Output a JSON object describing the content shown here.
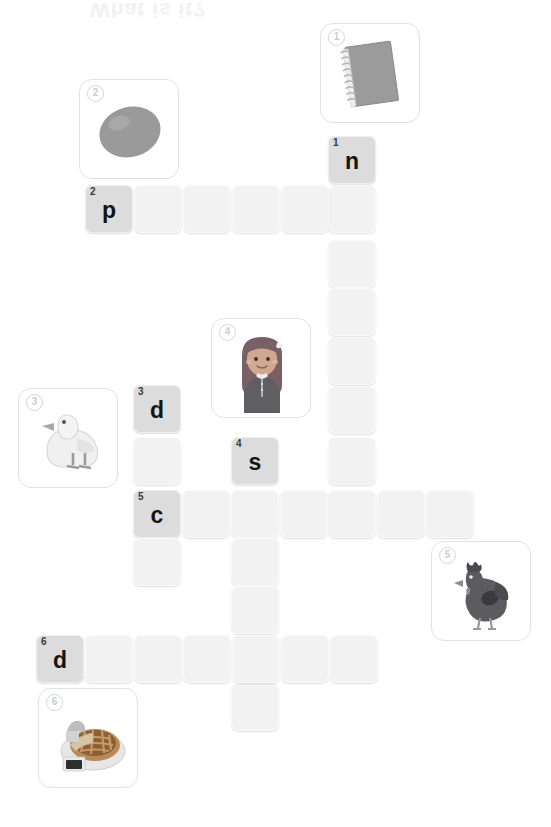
{
  "page": {
    "title_ghost": "What is it?",
    "type": "picture-crossword-worksheet"
  },
  "grid": {
    "cell_size": 48,
    "pitch_x": 49,
    "origin_x": 36,
    "filled_color": "#dcdcdc",
    "empty_color": "#f2f2f2"
  },
  "cells": [
    {
      "id": "c-1-n",
      "x": 328,
      "y": 136,
      "num": "1",
      "letter": "n",
      "filled": true
    },
    {
      "id": "c-r1-2",
      "x": 328,
      "y": 185,
      "num": "",
      "letter": "",
      "filled": false
    },
    {
      "id": "c-r1-3",
      "x": 328,
      "y": 240,
      "num": "",
      "letter": "",
      "filled": false
    },
    {
      "id": "c-r1-4",
      "x": 328,
      "y": 288,
      "num": "",
      "letter": "",
      "filled": false
    },
    {
      "id": "c-r1-5",
      "x": 328,
      "y": 337,
      "num": "",
      "letter": "",
      "filled": false
    },
    {
      "id": "c-r1-6",
      "x": 328,
      "y": 386,
      "num": "",
      "letter": "",
      "filled": false
    },
    {
      "id": "c-r1-7",
      "x": 328,
      "y": 437,
      "num": "",
      "letter": "",
      "filled": false
    },
    {
      "id": "c-r1-8",
      "x": 328,
      "y": 490,
      "num": "",
      "letter": "",
      "filled": false
    },
    {
      "id": "c-2-p",
      "x": 85,
      "y": 185,
      "num": "2",
      "letter": "p",
      "filled": true
    },
    {
      "id": "c-r2-2",
      "x": 134,
      "y": 185,
      "num": "",
      "letter": "",
      "filled": false
    },
    {
      "id": "c-r2-3",
      "x": 183,
      "y": 185,
      "num": "",
      "letter": "",
      "filled": false
    },
    {
      "id": "c-r2-4",
      "x": 232,
      "y": 185,
      "num": "",
      "letter": "",
      "filled": false
    },
    {
      "id": "c-r2-5",
      "x": 281,
      "y": 185,
      "num": "",
      "letter": "",
      "filled": false
    },
    {
      "id": "c-3-d",
      "x": 133,
      "y": 385,
      "num": "3",
      "letter": "d",
      "filled": true
    },
    {
      "id": "c-r3-2",
      "x": 133,
      "y": 437,
      "num": "",
      "letter": "",
      "filled": false
    },
    {
      "id": "c-4-s",
      "x": 231,
      "y": 437,
      "num": "4",
      "letter": "s",
      "filled": true
    },
    {
      "id": "c-5-c",
      "x": 133,
      "y": 490,
      "num": "5",
      "letter": "c",
      "filled": true
    },
    {
      "id": "c-r5-2",
      "x": 182,
      "y": 490,
      "num": "",
      "letter": "",
      "filled": false
    },
    {
      "id": "c-r5-3",
      "x": 231,
      "y": 490,
      "num": "",
      "letter": "",
      "filled": false
    },
    {
      "id": "c-r5-4",
      "x": 280,
      "y": 490,
      "num": "",
      "letter": "",
      "filled": false
    },
    {
      "id": "c-r5-5",
      "x": 377,
      "y": 490,
      "num": "",
      "letter": "",
      "filled": false
    },
    {
      "id": "c-r5-6",
      "x": 426,
      "y": 490,
      "num": "",
      "letter": "",
      "filled": false
    },
    {
      "id": "c-d-dn1",
      "x": 133,
      "y": 538,
      "num": "",
      "letter": "",
      "filled": false
    },
    {
      "id": "c-s-dn1",
      "x": 231,
      "y": 538,
      "num": "",
      "letter": "",
      "filled": false
    },
    {
      "id": "c-s-dn2",
      "x": 231,
      "y": 586,
      "num": "",
      "letter": "",
      "filled": false
    },
    {
      "id": "c-s-dn3",
      "x": 231,
      "y": 683,
      "num": "",
      "letter": "",
      "filled": false
    },
    {
      "id": "c-6-d",
      "x": 36,
      "y": 635,
      "num": "6",
      "letter": "d",
      "filled": true
    },
    {
      "id": "c-r6-2",
      "x": 85,
      "y": 635,
      "num": "",
      "letter": "",
      "filled": false
    },
    {
      "id": "c-r6-3",
      "x": 134,
      "y": 635,
      "num": "",
      "letter": "",
      "filled": false
    },
    {
      "id": "c-r6-4",
      "x": 183,
      "y": 635,
      "num": "",
      "letter": "",
      "filled": false
    },
    {
      "id": "c-r6-5",
      "x": 232,
      "y": 635,
      "num": "",
      "letter": "",
      "filled": false
    },
    {
      "id": "c-r6-6",
      "x": 281,
      "y": 635,
      "num": "",
      "letter": "",
      "filled": false
    },
    {
      "id": "c-r6-7",
      "x": 330,
      "y": 635,
      "num": "",
      "letter": "",
      "filled": false
    }
  ],
  "clues": [
    {
      "num": "1",
      "x": 320,
      "y": 23,
      "icon": "notebook-icon",
      "answer_hint": "notebook"
    },
    {
      "num": "2",
      "x": 79,
      "y": 79,
      "icon": "egg-icon",
      "answer_hint": "potato"
    },
    {
      "num": "3",
      "x": 18,
      "y": 388,
      "icon": "duck-icon",
      "answer_hint": "duck"
    },
    {
      "num": "4",
      "x": 211,
      "y": 318,
      "icon": "girl-icon",
      "answer_hint": "sister"
    },
    {
      "num": "5",
      "x": 431,
      "y": 541,
      "icon": "hen-icon",
      "answer_hint": "hen"
    },
    {
      "num": "6",
      "x": 38,
      "y": 688,
      "icon": "pie-icon",
      "answer_hint": "pie"
    }
  ]
}
